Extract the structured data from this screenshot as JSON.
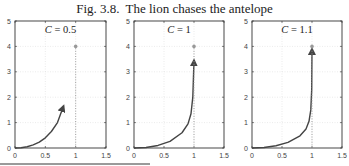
{
  "figure": {
    "number": "Fig. 3.8.",
    "title": "The lion chases the antelope"
  },
  "colors": {
    "curve": "#444444",
    "axes": "#333333",
    "grid": "#dddddd",
    "antelope": "#999999"
  },
  "chart_data": [
    {
      "type": "line",
      "title": "C = 0.5",
      "label_var": "C",
      "label_val": "0.5",
      "xlim": [
        0,
        1.5
      ],
      "ylim": [
        0,
        5
      ],
      "xticks": [
        0,
        0.5,
        1,
        1.5
      ],
      "xtick_labels": [
        "0",
        "0.5",
        "1",
        "1.5"
      ],
      "yticks": [
        0,
        1,
        2,
        3,
        4,
        5
      ],
      "ytick_labels": [
        "0",
        "1",
        "2",
        "3",
        "4",
        "5"
      ],
      "grid": true,
      "series": [
        {
          "name": "lion path",
          "x": [
            0,
            0.1,
            0.2,
            0.3,
            0.4,
            0.5,
            0.6,
            0.7,
            0.8
          ],
          "y": [
            0,
            0.01,
            0.05,
            0.12,
            0.23,
            0.4,
            0.65,
            1.0,
            1.65
          ],
          "arrow_end": true
        },
        {
          "name": "antelope path",
          "x": [
            1,
            1
          ],
          "y": [
            0,
            4
          ],
          "style": "dotted"
        }
      ],
      "points": [
        {
          "name": "antelope",
          "x": 1,
          "y": 4
        }
      ]
    },
    {
      "type": "line",
      "title": "C = 1",
      "label_var": "C",
      "label_val": "1",
      "xlim": [
        0,
        1.5
      ],
      "ylim": [
        0,
        5
      ],
      "xticks": [
        0,
        0.5,
        1,
        1.5
      ],
      "xtick_labels": [
        "0",
        "0.5",
        "1",
        "1.5"
      ],
      "yticks": [
        0,
        1,
        2,
        3,
        4,
        5
      ],
      "ytick_labels": [
        "0",
        "1",
        "2",
        "3",
        "4",
        "5"
      ],
      "grid": true,
      "series": [
        {
          "name": "lion path",
          "x": [
            0,
            0.2,
            0.4,
            0.6,
            0.8,
            0.9,
            0.95,
            0.98,
            1.0
          ],
          "y": [
            0,
            0.02,
            0.1,
            0.26,
            0.6,
            0.95,
            1.35,
            2.0,
            3.45
          ],
          "arrow_end": true
        },
        {
          "name": "antelope path",
          "x": [
            1,
            1
          ],
          "y": [
            0,
            4
          ],
          "style": "dotted"
        }
      ],
      "points": [
        {
          "name": "antelope",
          "x": 1,
          "y": 4
        }
      ]
    },
    {
      "type": "line",
      "title": "C = 1.1",
      "label_var": "C",
      "label_val": "1.1",
      "xlim": [
        0,
        1.5
      ],
      "ylim": [
        0,
        5
      ],
      "xticks": [
        0,
        0.5,
        1,
        1.5
      ],
      "xtick_labels": [
        "0",
        "0.5",
        "1",
        "1.5"
      ],
      "yticks": [
        0,
        1,
        2,
        3,
        4,
        5
      ],
      "ytick_labels": [
        "0",
        "1",
        "2",
        "3",
        "4",
        "5"
      ],
      "grid": true,
      "series": [
        {
          "name": "lion path",
          "x": [
            0,
            0.2,
            0.4,
            0.6,
            0.8,
            0.9,
            0.95,
            0.98,
            0.995,
            1.0
          ],
          "y": [
            0,
            0.02,
            0.09,
            0.22,
            0.48,
            0.75,
            1.05,
            1.5,
            2.3,
            3.9
          ],
          "arrow_end": true
        },
        {
          "name": "antelope path",
          "x": [
            1,
            1
          ],
          "y": [
            0,
            4
          ],
          "style": "dotted"
        }
      ],
      "points": [
        {
          "name": "antelope",
          "x": 1,
          "y": 4
        }
      ]
    }
  ]
}
